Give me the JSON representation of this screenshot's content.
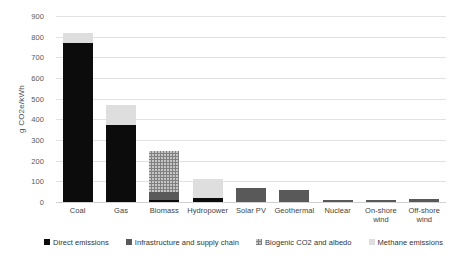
{
  "chart_data": {
    "type": "bar",
    "stacked": true,
    "title": "",
    "xlabel": "",
    "ylabel": "g CO2e/kWh",
    "ylim": [
      0,
      900
    ],
    "ytick_step": 100,
    "yticks": [
      900,
      800,
      700,
      600,
      500,
      400,
      300,
      200,
      100,
      0
    ],
    "grid": true,
    "legend_position": "bottom",
    "categories": [
      "Coal",
      "Gas",
      "Biomass",
      "Hydropower",
      "Solar PV",
      "Geothermal",
      "Nuclear",
      "On-shore wind",
      "Off-shore wind"
    ],
    "series": [
      {
        "name": "Direct emissions",
        "color": "#0c0c0c",
        "values": [
          770,
          375,
          10,
          18,
          0,
          0,
          0,
          0,
          0
        ]
      },
      {
        "name": "Infrastructure and supply chain",
        "color": "#595959",
        "values": [
          0,
          0,
          40,
          0,
          70,
          60,
          12,
          12,
          14
        ]
      },
      {
        "name": "Biogenic CO2 and albedo",
        "color": "#808080",
        "values": [
          0,
          0,
          195,
          0,
          0,
          0,
          0,
          0,
          0
        ]
      },
      {
        "name": "Methane emissions",
        "color": "#dedede",
        "values": [
          50,
          95,
          0,
          92,
          0,
          0,
          0,
          0,
          0
        ]
      }
    ],
    "totals": [
      820,
      470,
      245,
      110,
      70,
      60,
      12,
      12,
      14
    ]
  },
  "axis": {
    "y_label": "g CO2e/kWh",
    "y_tick_labels": [
      "900",
      "800",
      "700",
      "600",
      "500",
      "400",
      "300",
      "200",
      "100",
      "0"
    ]
  },
  "x_axis": {
    "labels": [
      "Coal",
      "Gas",
      "Biomass",
      "Hydropower",
      "Solar PV",
      "Geothermal",
      "Nuclear",
      "On-shore wind",
      "Off-shore wind"
    ]
  },
  "legend": {
    "items": [
      {
        "label": "Direct emissions",
        "color": "#0c0c0c",
        "pattern": "solid"
      },
      {
        "label": "Infrastructure and supply chain",
        "color": "#595959",
        "pattern": "solid"
      },
      {
        "label": "Biogenic CO2 and albedo",
        "color": "#808080",
        "pattern": "dotted"
      },
      {
        "label": "Methane emissions",
        "color": "#dedede",
        "pattern": "solid"
      }
    ]
  }
}
